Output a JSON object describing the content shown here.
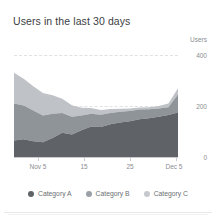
{
  "card": {
    "title": "Users in the last 30 days"
  },
  "axis": {
    "y_name": "Users",
    "y_ticks": [
      "400",
      "200",
      "0"
    ],
    "x_ticks": [
      "Nov 5",
      "15",
      "25",
      "Dec 5"
    ]
  },
  "legend": {
    "items": [
      {
        "label": "Category A",
        "color": "#5f6368"
      },
      {
        "label": "Category B",
        "color": "#9aa0a6"
      },
      {
        "label": "Category C",
        "color": "#c5c8cc"
      }
    ]
  },
  "colors": {
    "series_a": "#5f6368",
    "series_b": "#8f9499",
    "series_c": "#bfc3c7",
    "grid": "#dfe1e3",
    "axis_text": "#8a8d91",
    "title_text": "#3c4043"
  },
  "chart_data": {
    "type": "area",
    "title": "Users in the last 30 days",
    "xlabel": "",
    "ylabel": "Users",
    "ylim": [
      0,
      400
    ],
    "yticks": [
      0,
      200,
      400
    ],
    "grid": true,
    "stacked": true,
    "legend_position": "bottom",
    "x": [
      "Nov 1",
      "Nov 3",
      "Nov 5",
      "Nov 7",
      "Nov 9",
      "Nov 11",
      "Nov 13",
      "Nov 15",
      "Nov 17",
      "Nov 19",
      "Nov 21",
      "Nov 23",
      "Nov 25",
      "Nov 27",
      "Nov 29",
      "Dec 1",
      "Dec 3",
      "Dec 5"
    ],
    "xtick_labels": [
      "Nov 5",
      "15",
      "25",
      "Dec 5"
    ],
    "series": [
      {
        "name": "Category A",
        "color": "#5f6368",
        "values": [
          65,
          70,
          62,
          58,
          75,
          95,
          88,
          105,
          120,
          118,
          128,
          135,
          140,
          148,
          152,
          158,
          165,
          175
        ]
      },
      {
        "name": "Category B",
        "color": "#8f9499",
        "values": [
          145,
          132,
          120,
          105,
          95,
          78,
          70,
          58,
          50,
          48,
          45,
          42,
          40,
          38,
          35,
          32,
          30,
          70
        ]
      },
      {
        "name": "Category C",
        "color": "#bfc3c7",
        "values": [
          120,
          105,
          95,
          88,
          72,
          55,
          45,
          30,
          22,
          18,
          15,
          12,
          10,
          8,
          8,
          10,
          15,
          25
        ]
      }
    ]
  }
}
